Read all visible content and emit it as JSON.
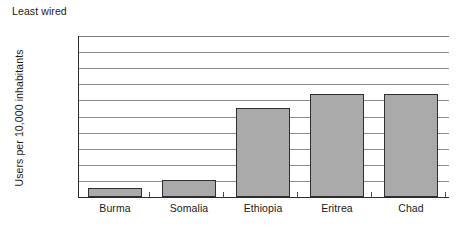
{
  "chart_data": {
    "type": "bar",
    "title": "Least wired",
    "xlabel": "",
    "ylabel": "Users per 10,000 inhabitants",
    "categories": [
      "Burma",
      "Somalia",
      "Ethiopia",
      "Eritrea",
      "Chad"
    ],
    "values": [
      0.11,
      0.21,
      1.1,
      1.28,
      1.28
    ],
    "ylim": [
      0,
      2.0
    ],
    "ytick_labels": [
      "0",
      "0.2",
      "0.4",
      "0.6",
      "0.8",
      "1.0",
      "1.2",
      "1.4",
      "1.6",
      "1.8",
      "2.0"
    ],
    "ytick_values": [
      0,
      0.2,
      0.4,
      0.6,
      0.8,
      1.0,
      1.2,
      1.4,
      1.6,
      1.8,
      2.0
    ],
    "grid": true,
    "legend": "none",
    "series": [
      {
        "name": "Users per 10,000 inhabitants",
        "values": [
          0.11,
          0.21,
          1.1,
          1.28,
          1.28
        ]
      }
    ],
    "colors": {
      "bar_fill": "#aaaaaa",
      "bar_stroke": "#2f2f2f",
      "gridline": "#8d8d8d",
      "axis": "#2b2b2b",
      "text": "#1a1a1a",
      "background": "#ffffff"
    }
  }
}
